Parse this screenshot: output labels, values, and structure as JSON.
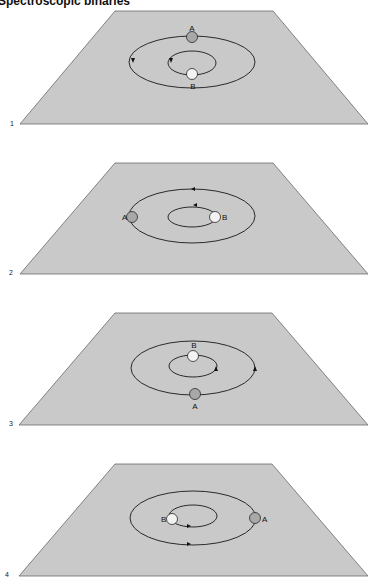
{
  "title": "Spectroscopic binaries",
  "colors": {
    "plane_fill": "#c9c9c9",
    "plane_stroke": "#6a6a6a",
    "orbit_stroke": "#2a2a2a",
    "star_a_fill": "#a8a8a8",
    "star_b_fill": "#f2f2f2"
  },
  "panels": [
    {
      "number": "1",
      "star_a_label": "A",
      "star_b_label": "B",
      "star_a_position": "top of outer orbit",
      "star_b_position": "bottom of inner orbit",
      "arrow_direction": "counter-clockwise (left side)"
    },
    {
      "number": "2",
      "star_a_label": "A",
      "star_b_label": "B",
      "star_a_position": "left of outer orbit",
      "star_b_position": "right of inner orbit",
      "arrow_direction": "leftward (top)"
    },
    {
      "number": "3",
      "star_a_label": "A",
      "star_b_label": "B",
      "star_a_position": "bottom of outer orbit",
      "star_b_position": "top of inner orbit",
      "arrow_direction": "upward (right side)"
    },
    {
      "number": "4",
      "star_a_label": "A",
      "star_b_label": "B",
      "star_a_position": "right of outer orbit",
      "star_b_position": "left of inner orbit",
      "arrow_direction": "rightward (bottom)"
    }
  ]
}
